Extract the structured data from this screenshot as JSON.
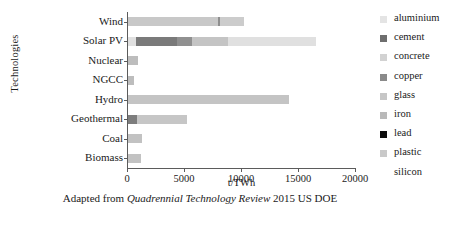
{
  "chart_data": {
    "type": "bar",
    "orientation": "horizontal",
    "stacked": true,
    "title": "",
    "xlabel": "t/TWh",
    "ylabel": "Technologies",
    "xlim": [
      0,
      20000
    ],
    "xticks": [
      0,
      5000,
      10000,
      15000,
      20000
    ],
    "xtick_labels": [
      "0",
      "5000",
      "10000",
      "15000",
      "20000"
    ],
    "grid": false,
    "legend_position": "right",
    "categories": [
      "Wind",
      "Solar PV",
      "Nuclear",
      "NGCC",
      "Hydro",
      "Geothermal",
      "Coal",
      "Biomass"
    ],
    "materials": [
      "aluminium",
      "cement",
      "concrete",
      "copper",
      "glass",
      "iron",
      "lead",
      "plastic",
      "silicon"
    ],
    "series": [
      {
        "name": "aluminium",
        "color": "#e2e2e2",
        "values": [
          0,
          700,
          0,
          0,
          0,
          0,
          0,
          0
        ]
      },
      {
        "name": "cement",
        "color": "#7a7a7a",
        "values": [
          0,
          3600,
          0,
          0,
          0,
          700,
          0,
          0
        ]
      },
      {
        "name": "concrete",
        "color": "#c8c8c8",
        "values": [
          7900,
          0,
          700,
          420,
          13400,
          0,
          980,
          880
        ]
      },
      {
        "name": "copper",
        "color": "#909090",
        "values": [
          160,
          1300,
          0,
          0,
          0,
          0,
          0,
          0
        ]
      },
      {
        "name": "glass",
        "color": "#bdbdbd",
        "values": [
          0,
          3200,
          0,
          0,
          0,
          0,
          0,
          0
        ]
      },
      {
        "name": "iron",
        "color": "#b5b5b5",
        "values": [
          2140,
          0,
          200,
          130,
          700,
          4500,
          270,
          220
        ]
      },
      {
        "name": "lead",
        "color": "#121212",
        "values": [
          0,
          0,
          0,
          0,
          0,
          0,
          0,
          0
        ]
      },
      {
        "name": "plastic",
        "color": "#c0c0c0",
        "values": [
          0,
          0,
          0,
          0,
          0,
          0,
          0,
          0
        ]
      },
      {
        "name": "silicon",
        "color": "#ededed",
        "values": [
          0,
          7700,
          0,
          0,
          0,
          0,
          0,
          0
        ]
      }
    ],
    "totals": [
      10200,
      16500,
      900,
      550,
      14100,
      5200,
      1250,
      1100
    ],
    "bars": [
      {
        "category": "Wind",
        "total": 10200,
        "segments": [
          {
            "material": "concrete",
            "value": 7900,
            "color": "#c8c8c8"
          },
          {
            "material": "copper",
            "value": 160,
            "color": "#8e8e8e"
          },
          {
            "material": "iron",
            "value": 2140,
            "color": "#cccccc"
          }
        ]
      },
      {
        "category": "Solar PV",
        "total": 16500,
        "segments": [
          {
            "material": "aluminium",
            "value": 700,
            "color": "#e0e0e0"
          },
          {
            "material": "cement",
            "value": 3600,
            "color": "#7a7a7a"
          },
          {
            "material": "copper",
            "value": 1300,
            "color": "#909090"
          },
          {
            "material": "glass",
            "value": 3200,
            "color": "#c4c4c4"
          },
          {
            "material": "silicon",
            "value": 7700,
            "color": "#e0e0e0"
          }
        ]
      },
      {
        "category": "Nuclear",
        "total": 900,
        "segments": [
          {
            "material": "concrete",
            "value": 900,
            "color": "#bdbdbd"
          }
        ]
      },
      {
        "category": "NGCC",
        "total": 550,
        "segments": [
          {
            "material": "concrete",
            "value": 550,
            "color": "#bdbdbd"
          }
        ]
      },
      {
        "category": "Hydro",
        "total": 14100,
        "segments": [
          {
            "material": "concrete",
            "value": 14100,
            "color": "#c4c4c4"
          }
        ]
      },
      {
        "category": "Geothermal",
        "total": 5200,
        "segments": [
          {
            "material": "cement",
            "value": 750,
            "color": "#7d7d7d"
          },
          {
            "material": "iron",
            "value": 4450,
            "color": "#c6c6c6"
          }
        ]
      },
      {
        "category": "Coal",
        "total": 1250,
        "segments": [
          {
            "material": "concrete",
            "value": 1250,
            "color": "#c2c2c2"
          }
        ]
      },
      {
        "category": "Biomass",
        "total": 1100,
        "segments": [
          {
            "material": "concrete",
            "value": 1100,
            "color": "#c2c2c2"
          }
        ]
      }
    ]
  },
  "axis": {
    "y_title": "Technologies",
    "x_unit": "t/TWh"
  },
  "caption": {
    "prefix": "Adapted from ",
    "source_title": "Quadrennial Technology Review",
    "suffix": " 2015 US DOE"
  },
  "legend": {
    "items": [
      {
        "label": "aluminium",
        "color": "#e4e4e4",
        "has_swatch": true
      },
      {
        "label": "cement",
        "color": "#6e6e6e",
        "has_swatch": true
      },
      {
        "label": "concrete",
        "color": "#d2d2d2",
        "has_swatch": true
      },
      {
        "label": "copper",
        "color": "#8a8a8a",
        "has_swatch": true
      },
      {
        "label": "glass",
        "color": "#c6c6c6",
        "has_swatch": true
      },
      {
        "label": "iron",
        "color": "#b9b9b9",
        "has_swatch": true
      },
      {
        "label": "lead",
        "color": "#0d0d0d",
        "has_swatch": true
      },
      {
        "label": "plastic",
        "color": "#c9c9c9",
        "has_swatch": true
      },
      {
        "label": "silicon",
        "color": "#ffffff",
        "has_swatch": false
      }
    ]
  }
}
